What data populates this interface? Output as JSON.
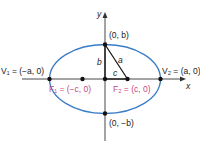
{
  "diagram": {
    "type": "ellipse-horizontal-major-axis",
    "colors": {
      "ellipse": "#3a7cc6",
      "axes": "#333333",
      "points": "#111111",
      "focus_labels": "#c8487a",
      "text": "#222222"
    },
    "axes": {
      "x_label": "x",
      "y_label": "y"
    },
    "labels": {
      "top_vertex": "(0, b)",
      "bottom_vertex": "(0, −b)",
      "v1": "V₁ = (−a, 0)",
      "v2": "V₂ = (a, 0)",
      "f1": "F₁ = (−c, 0)",
      "f2": "F₂ = (c, 0)",
      "seg_a": "a",
      "seg_b": "b",
      "seg_c": "c"
    }
  }
}
